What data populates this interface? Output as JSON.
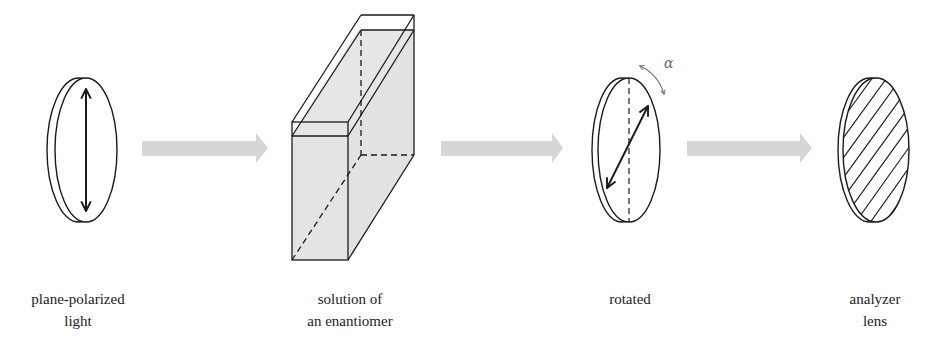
{
  "diagram": {
    "stages": [
      {
        "id": "plane-polarized-light",
        "label_lines": [
          "plane-polarized",
          "light"
        ]
      },
      {
        "id": "solution-of-enantiomer",
        "label_lines": [
          "solution of",
          "an enantiomer"
        ]
      },
      {
        "id": "rotated",
        "label_lines": [
          "rotated"
        ]
      },
      {
        "id": "analyzer-lens",
        "label_lines": [
          "analyzer",
          "lens"
        ]
      }
    ],
    "rotation_symbol": "α",
    "colors": {
      "stroke": "#1a1a1a",
      "arrow_fill": "#d6d6d6",
      "solution_fill": "#e4e4e4",
      "rotation_arrow": "#777777"
    }
  }
}
